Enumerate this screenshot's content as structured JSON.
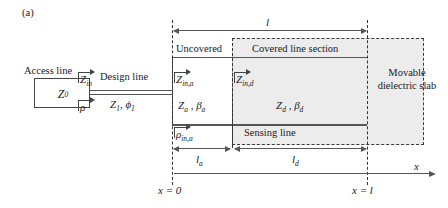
{
  "figure": {
    "panel_label": "(a)",
    "type": "transmission-line-schematic"
  },
  "labels": {
    "access_line": "Access line",
    "design_line": "Design line",
    "uncovered": "Uncovered",
    "covered_line_section": "Covered line section",
    "sensing_line": "Sensing line",
    "movable_dielectric_slab": "Movable dielectric slab"
  },
  "symbols": {
    "z0": "Z",
    "z0_sub": "0",
    "zin": "Z",
    "zin_sub": "in",
    "rho": "ρ",
    "z1": "Z",
    "z1_sub": "1",
    "phi1": "ϕ",
    "phi1_sub": "1",
    "zin_a": "Z",
    "zin_a_sub": "in,a",
    "za": "Z",
    "za_sub": "a",
    "beta_a": "β",
    "beta_a_sub": "a",
    "rho_in_a": "ρ",
    "rho_in_a_sub": "in,a",
    "zin_d": "Z",
    "zin_d_sub": "in,d",
    "zd": "Z",
    "zd_sub": "d",
    "beta_d": "β",
    "beta_d_sub": "d"
  },
  "dimensions": {
    "total_length": "l",
    "uncovered_length": "l",
    "uncovered_length_sub": "a",
    "covered_length": "l",
    "covered_length_sub": "d"
  },
  "axis": {
    "name": "x",
    "origin_label": "x = 0",
    "end_label": "x = l"
  },
  "colors": {
    "line": "#555555",
    "dashed_boundary": "#333333",
    "slab_fill": "#ececec",
    "text": "#1a1a1a",
    "background": "#ffffff"
  }
}
